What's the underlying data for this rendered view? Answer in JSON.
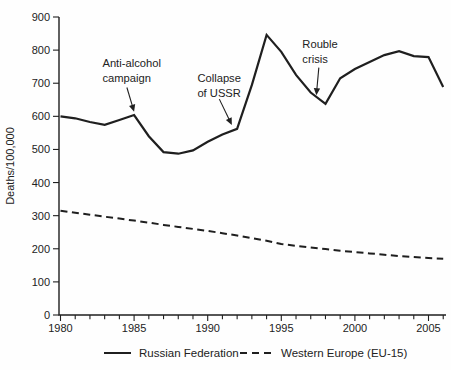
{
  "figure": {
    "background": "#fefefe",
    "line_color": "#1f1f1f",
    "text_color": "#222222"
  },
  "legend": {
    "items": [
      {
        "label": "Russian Federation",
        "style": "solid"
      },
      {
        "label": "Western Europe (EU-15)",
        "style": "dashed"
      }
    ]
  },
  "chart_data": {
    "type": "line",
    "title": "",
    "xlabel": "",
    "ylabel": "Deaths/100,000",
    "ylim": [
      0,
      900
    ],
    "yticks": [
      0,
      100,
      200,
      300,
      400,
      500,
      600,
      700,
      800,
      900
    ],
    "xlim": [
      1980,
      2006
    ],
    "xticks_major": [
      1980,
      1985,
      1990,
      1995,
      2000,
      2005
    ],
    "xticks_minor_every": 1,
    "grid": false,
    "legend_position": "bottom",
    "x": [
      1980,
      1981,
      1982,
      1983,
      1984,
      1985,
      1986,
      1987,
      1988,
      1989,
      1990,
      1991,
      1992,
      1993,
      1994,
      1995,
      1996,
      1997,
      1998,
      1999,
      2000,
      2001,
      2002,
      2003,
      2004,
      2005,
      2006
    ],
    "series": [
      {
        "name": "Russian Federation",
        "style": "solid",
        "values": [
          600,
          594,
          583,
          574,
          589,
          604,
          540,
          492,
          487,
          497,
          523,
          545,
          562,
          695,
          846,
          795,
          725,
          672,
          638,
          715,
          743,
          764,
          785,
          797,
          782,
          779,
          689
        ]
      },
      {
        "name": "Western Europe (EU-15)",
        "style": "dashed",
        "values": [
          315,
          309,
          303,
          297,
          291,
          285,
          279,
          272,
          266,
          260,
          254,
          247,
          240,
          232,
          224,
          214,
          209,
          204,
          199,
          194,
          190,
          186,
          182,
          178,
          175,
          172,
          170
        ]
      }
    ],
    "annotations": [
      {
        "id": "anti-alcohol-campaign",
        "lines": [
          "Anti-alcohol",
          "campaign"
        ],
        "text_at": {
          "year": 1982.85,
          "value": 750
        },
        "arrow_from": {
          "year": 1984.51,
          "value": 687
        },
        "arrow_to": {
          "year": 1985.0,
          "value": 614
        }
      },
      {
        "id": "collapse-of-ussr",
        "lines": [
          "Collapse",
          "of USSR"
        ],
        "text_at": {
          "year": 1989.3,
          "value": 704
        },
        "arrow_from": {
          "year": 1990.79,
          "value": 652
        },
        "arrow_to": {
          "year": 1991.64,
          "value": 574
        }
      },
      {
        "id": "rouble-crisis",
        "lines": [
          "Rouble",
          "crisis"
        ],
        "text_at": {
          "year": 1996.43,
          "value": 806
        },
        "arrow_from": {
          "year": 1997.55,
          "value": 747
        },
        "arrow_to": {
          "year": 1997.38,
          "value": 664
        }
      }
    ]
  }
}
